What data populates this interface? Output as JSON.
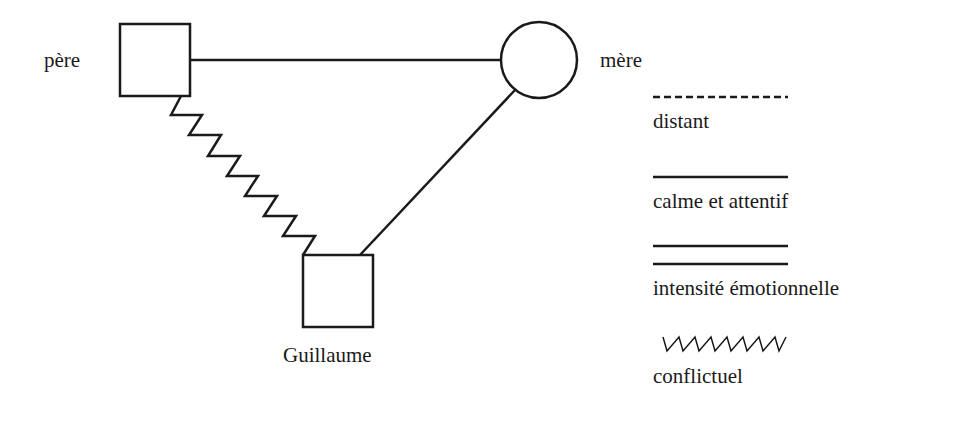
{
  "diagram": {
    "type": "genogram",
    "nodes": [
      {
        "id": "pere",
        "label": "père",
        "shape": "square"
      },
      {
        "id": "mere",
        "label": "mère",
        "shape": "circle"
      },
      {
        "id": "guillaume",
        "label": "Guillaume",
        "shape": "square"
      }
    ],
    "edges": [
      {
        "from": "pere",
        "to": "mere",
        "style": "calme et attentif"
      },
      {
        "from": "pere",
        "to": "guillaume",
        "style": "conflictuel"
      },
      {
        "from": "mere",
        "to": "guillaume",
        "style": "calme et attentif"
      }
    ]
  },
  "legend": {
    "items": [
      {
        "line": "dashed",
        "label": "distant"
      },
      {
        "line": "solid",
        "label": "calme et attentif"
      },
      {
        "line": "double",
        "label": "intensité émotionnelle"
      },
      {
        "line": "zigzag",
        "label": "conflictuel"
      }
    ]
  },
  "colors": {
    "stroke": "#1a1a1a",
    "background": "#ffffff"
  }
}
